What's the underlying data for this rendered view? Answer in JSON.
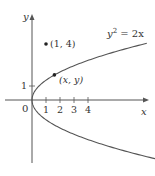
{
  "figure": {
    "type": "parabola-diagram",
    "equation_label": {
      "base": "y",
      "sup": "2",
      "rest": " = 2x"
    },
    "axes": {
      "x_label": "x",
      "y_label": "y",
      "origin_label": "0",
      "x_ticks": [
        "1",
        "2",
        "3",
        "4"
      ],
      "y_ticks": [
        "1"
      ]
    },
    "points": [
      {
        "label": "(1, 4)",
        "x": 1,
        "y": 4
      },
      {
        "label": "(x, y)",
        "x": 1.6,
        "y": 1.79
      }
    ],
    "colors": {
      "curve": "#555555",
      "axis": "#555555",
      "text": "#333333",
      "point": "#222222"
    }
  },
  "chart_data": {
    "type": "line",
    "title": "",
    "xlabel": "x",
    "ylabel": "y",
    "curve": "y^2 = 2x",
    "x_ticks": [
      1,
      2,
      3,
      4
    ],
    "y_ticks": [
      1
    ],
    "xlim": [
      -2,
      8.3
    ],
    "ylim": [
      -4.5,
      6
    ],
    "points": [
      {
        "label": "(1, 4)",
        "x": 1,
        "y": 4
      },
      {
        "label": "(x, y)",
        "x": 1.6,
        "y": 1.79
      }
    ],
    "grid": false
  }
}
